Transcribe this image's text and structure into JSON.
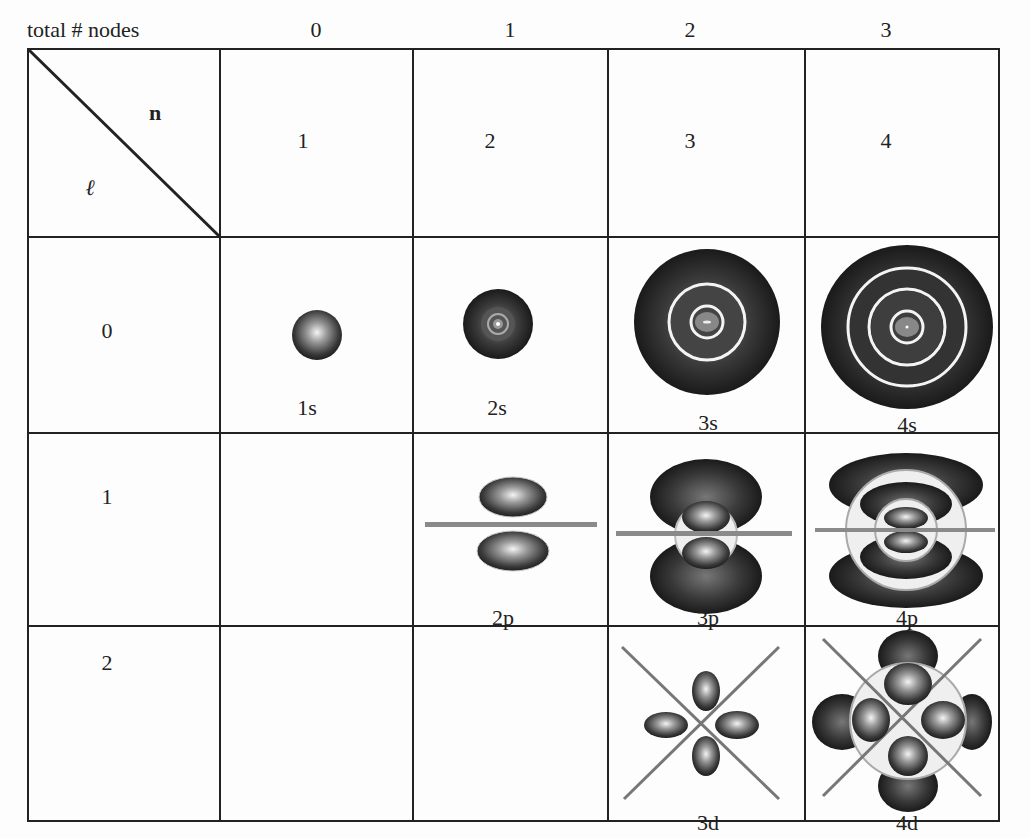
{
  "header": {
    "row_label": "total # nodes",
    "node_counts": [
      "0",
      "1",
      "2",
      "3"
    ]
  },
  "corner": {
    "n_label": "n",
    "l_label": "ℓ"
  },
  "columns_n": [
    "1",
    "2",
    "3",
    "4"
  ],
  "rows_l": [
    "0",
    "1",
    "2"
  ],
  "orbitals": {
    "s": [
      "1s",
      "2s",
      "3s",
      "4s"
    ],
    "p": [
      "2p",
      "3p",
      "4p"
    ],
    "d": [
      "3d",
      "4d"
    ]
  },
  "colors": {
    "line": "#222222",
    "node_plane": "#8a8a8a",
    "lobe_dark": "#2a2a2a",
    "lobe_light": "#e8e8e8"
  }
}
